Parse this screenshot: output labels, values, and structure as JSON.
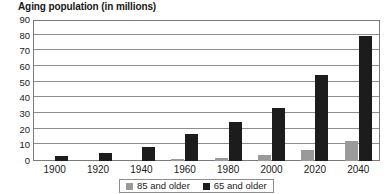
{
  "chart_data": {
    "type": "bar",
    "title": "Aging population (in millions)",
    "xlabel": "",
    "ylabel": "",
    "ylim": [
      0,
      90
    ],
    "ytick_step": 10,
    "yticks": [
      90,
      80,
      70,
      60,
      50,
      40,
      30,
      20,
      10,
      0
    ],
    "grid": true,
    "legend_position": "bottom",
    "categories": [
      "1900",
      "1920",
      "1940",
      "1960",
      "1980",
      "2000",
      "2020",
      "2040"
    ],
    "series": [
      {
        "name": "85 and older",
        "color": "#9a9a9a",
        "values": [
          0,
          0,
          0,
          1,
          2,
          4,
          7,
          13
        ]
      },
      {
        "name": "65 and older",
        "color": "#1c1c1c",
        "values": [
          3,
          5,
          9,
          17,
          25,
          34,
          55,
          80
        ]
      }
    ]
  },
  "legend": {
    "items": [
      {
        "label": "85 and older",
        "swatch": "#9a9a9a"
      },
      {
        "label": "65 and older",
        "swatch": "#1c1c1c"
      }
    ]
  }
}
